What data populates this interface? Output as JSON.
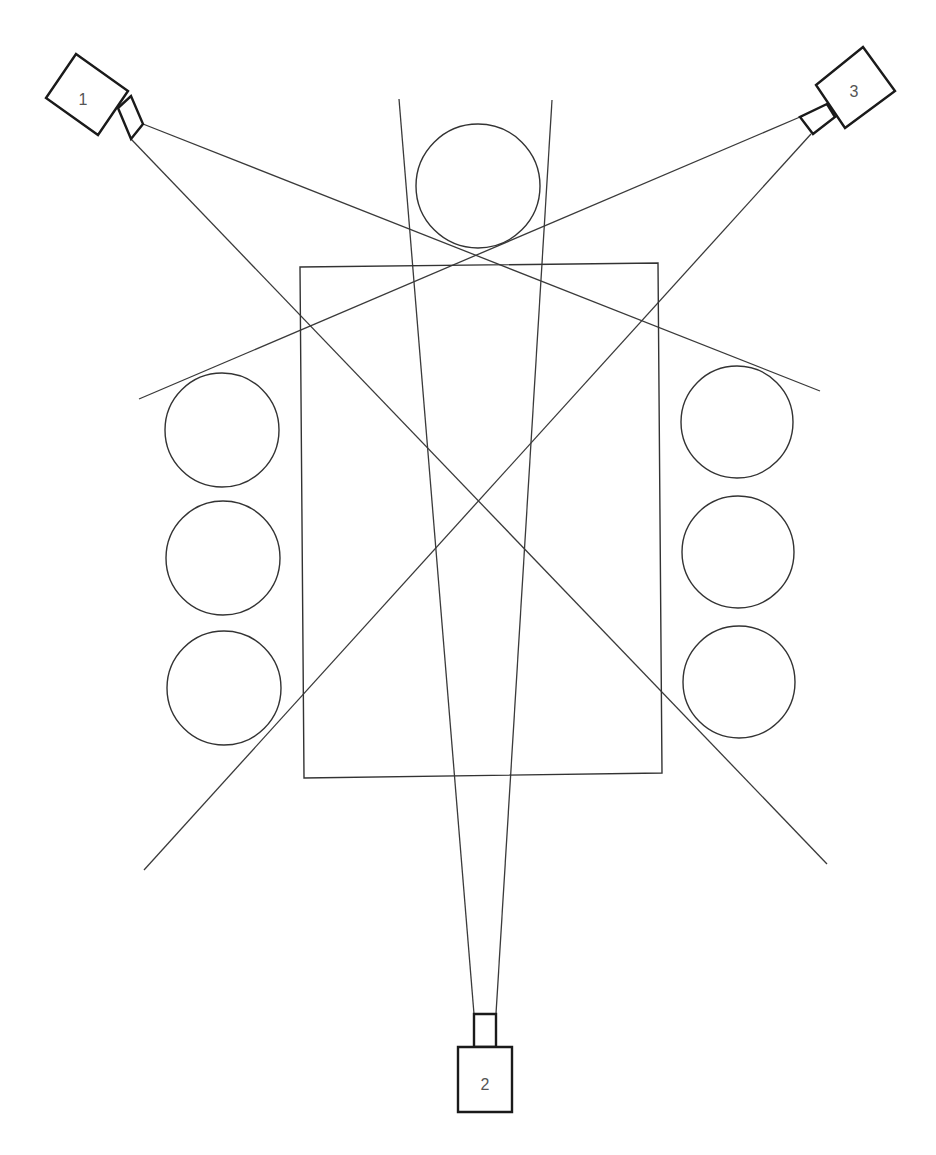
{
  "diagram": {
    "type": "camera-coverage-layout",
    "colors": {
      "line": "#3a3a3a",
      "camera_outline": "#1a1a1a",
      "background": "#ffffff",
      "label": "#555555"
    },
    "table": {
      "points": "300,267 658,263 662,773 304,778"
    },
    "seats": [
      {
        "id": "top",
        "cx": 478,
        "cy": 186,
        "r": 62
      },
      {
        "id": "left-1",
        "cx": 222,
        "cy": 430,
        "r": 57
      },
      {
        "id": "left-2",
        "cx": 223,
        "cy": 558,
        "r": 57
      },
      {
        "id": "left-3",
        "cx": 224,
        "cy": 688,
        "r": 57
      },
      {
        "id": "right-1",
        "cx": 737,
        "cy": 422,
        "r": 56
      },
      {
        "id": "right-2",
        "cx": 738,
        "cy": 552,
        "r": 56
      },
      {
        "id": "right-3",
        "cx": 739,
        "cy": 682,
        "r": 56
      }
    ],
    "cameras": [
      {
        "label": "1",
        "body": "76,54 128,91 98,135 46,98",
        "lens": "118,108 131,96 143,124 131,139 ",
        "label_pos": {
          "x": 83,
          "y": 101
        },
        "view_lines": [
          {
            "x1": 143,
            "y1": 124,
            "x2": 820,
            "y2": 391
          },
          {
            "x1": 131,
            "y1": 139,
            "x2": 827,
            "y2": 864
          }
        ]
      },
      {
        "label": "2",
        "body": "458,1047 512,1047 512,1112 458,1112",
        "lens": "474,1047 474,1014 496,1014 496,1047",
        "label_pos": {
          "x": 485,
          "y": 1086
        },
        "view_lines": [
          {
            "x1": 474,
            "y1": 1014,
            "x2": 399,
            "y2": 99
          },
          {
            "x1": 496,
            "y1": 1014,
            "x2": 552,
            "y2": 100
          }
        ]
      },
      {
        "label": "3",
        "body": "863,47 895,91 845,128 816,85",
        "lens": "827,104 835,117 813,134 800,117",
        "label_pos": {
          "x": 854,
          "y": 93
        },
        "view_lines": [
          {
            "x1": 800,
            "y1": 117,
            "x2": 139,
            "y2": 399
          },
          {
            "x1": 811,
            "y1": 134,
            "x2": 144,
            "y2": 870
          }
        ]
      }
    ]
  }
}
